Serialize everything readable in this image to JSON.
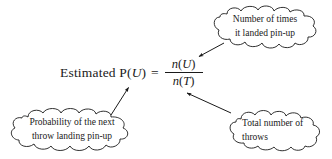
{
  "figure": {
    "background_color": "#ffffff",
    "ink_color": "#1a1a1a"
  },
  "equation": {
    "lead_label": "Estimated P(",
    "lead_var": "U",
    "lead_close": ")",
    "equals": "=",
    "numerator_fn": "n",
    "numerator_open": "(",
    "numerator_var": "U",
    "numerator_close": ")",
    "denominator_fn": "n",
    "denominator_open": "(",
    "denominator_var": "T",
    "denominator_close": ")",
    "full_text": "Estimated P(U) = n(U) / n(T)"
  },
  "callouts": [
    {
      "id": "top-right",
      "shape": "cloud",
      "line1": "Number of times",
      "line2": "it landed pin-up",
      "points_to": "numerator n(U)"
    },
    {
      "id": "bottom-left",
      "shape": "cloud",
      "line1": "Probability of the next",
      "line2": "throw landing pin-up",
      "points_to": "Estimated P(U)"
    },
    {
      "id": "bottom-right",
      "shape": "cloud",
      "line1": "Total number of",
      "line2": "throws",
      "points_to": "denominator n(T)"
    }
  ],
  "arrows": [
    {
      "id": "arrow-to-numerator",
      "from": "top-right callout",
      "to": "numerator n(U)"
    },
    {
      "id": "arrow-to-probability",
      "from": "bottom-left callout",
      "to": "Estimated P(U)"
    },
    {
      "id": "arrow-to-denominator",
      "from": "bottom-right callout",
      "to": "denominator n(T)"
    }
  ]
}
